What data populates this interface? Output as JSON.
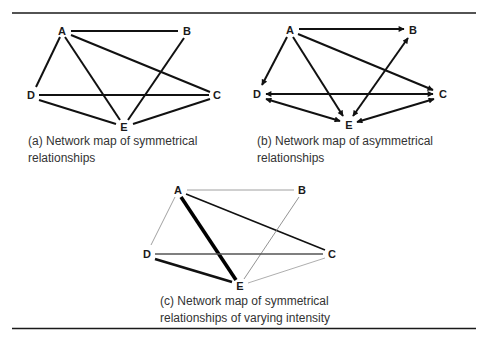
{
  "figure": {
    "panels": [
      {
        "id": "a",
        "caption_line1": "(a) Network map of symmetrical",
        "caption_line2": "relationships",
        "nodes": {
          "A": "A",
          "B": "B",
          "C": "C",
          "D": "D",
          "E": "E"
        },
        "edges": [
          {
            "from": "A",
            "to": "B",
            "type": "undirected",
            "weight": "normal"
          },
          {
            "from": "A",
            "to": "C",
            "type": "undirected",
            "weight": "normal"
          },
          {
            "from": "A",
            "to": "D",
            "type": "undirected",
            "weight": "normal"
          },
          {
            "from": "A",
            "to": "E",
            "type": "undirected",
            "weight": "normal"
          },
          {
            "from": "B",
            "to": "E",
            "type": "undirected",
            "weight": "normal"
          },
          {
            "from": "D",
            "to": "C",
            "type": "undirected",
            "weight": "normal"
          },
          {
            "from": "D",
            "to": "E",
            "type": "undirected",
            "weight": "normal"
          },
          {
            "from": "C",
            "to": "E",
            "type": "undirected",
            "weight": "normal"
          }
        ]
      },
      {
        "id": "b",
        "caption_line1": "(b) Network map of asymmetrical",
        "caption_line2": "relationships",
        "nodes": {
          "A": "A",
          "B": "B",
          "C": "C",
          "D": "D",
          "E": "E"
        },
        "edges": [
          {
            "from": "A",
            "to": "B",
            "type": "directed"
          },
          {
            "from": "A",
            "to": "C",
            "type": "directed"
          },
          {
            "from": "A",
            "to": "D",
            "type": "directed"
          },
          {
            "from": "A",
            "to": "E",
            "type": "directed"
          },
          {
            "from": "B",
            "to": "E",
            "type": "bidirectional"
          },
          {
            "from": "D",
            "to": "C",
            "type": "bidirectional"
          },
          {
            "from": "D",
            "to": "E",
            "type": "bidirectional"
          },
          {
            "from": "C",
            "to": "E",
            "type": "bidirectional"
          }
        ]
      },
      {
        "id": "c",
        "caption_line1": "(c) Network map of symmetrical",
        "caption_line2": "relationships of varying intensity",
        "nodes": {
          "A": "A",
          "B": "B",
          "C": "C",
          "D": "D",
          "E": "E"
        },
        "edges": [
          {
            "from": "A",
            "to": "B",
            "type": "undirected",
            "weight": "thin"
          },
          {
            "from": "A",
            "to": "C",
            "type": "undirected",
            "weight": "medium"
          },
          {
            "from": "A",
            "to": "D",
            "type": "undirected",
            "weight": "thin"
          },
          {
            "from": "A",
            "to": "E",
            "type": "undirected",
            "weight": "heavy"
          },
          {
            "from": "B",
            "to": "E",
            "type": "undirected",
            "weight": "thin"
          },
          {
            "from": "D",
            "to": "C",
            "type": "undirected",
            "weight": "medium-light"
          },
          {
            "from": "D",
            "to": "E",
            "type": "undirected",
            "weight": "thick"
          },
          {
            "from": "C",
            "to": "E",
            "type": "undirected",
            "weight": "thin"
          }
        ]
      }
    ]
  }
}
